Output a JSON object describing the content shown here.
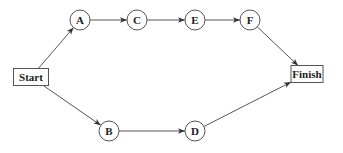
{
  "diagram": {
    "type": "network/precedence diagram",
    "nodes": [
      {
        "id": "start",
        "label": "Start",
        "shape": "box",
        "cx": 31,
        "cy": 77,
        "w": 35,
        "h": 17
      },
      {
        "id": "A",
        "label": "A",
        "shape": "circle",
        "cx": 80,
        "cy": 20,
        "r": 10
      },
      {
        "id": "C",
        "label": "C",
        "shape": "circle",
        "cx": 137,
        "cy": 20,
        "r": 10
      },
      {
        "id": "E",
        "label": "E",
        "shape": "circle",
        "cx": 195,
        "cy": 20,
        "r": 10
      },
      {
        "id": "F",
        "label": "F",
        "shape": "circle",
        "cx": 250,
        "cy": 20,
        "r": 10
      },
      {
        "id": "B",
        "label": "B",
        "shape": "circle",
        "cx": 109,
        "cy": 131,
        "r": 10
      },
      {
        "id": "D",
        "label": "D",
        "shape": "circle",
        "cx": 195,
        "cy": 131,
        "r": 10
      },
      {
        "id": "finish",
        "label": "Finish",
        "shape": "box",
        "cx": 307,
        "cy": 74,
        "w": 32,
        "h": 17
      }
    ],
    "edges": [
      {
        "from": "start",
        "to": "A"
      },
      {
        "from": "A",
        "to": "C"
      },
      {
        "from": "C",
        "to": "E"
      },
      {
        "from": "E",
        "to": "F"
      },
      {
        "from": "F",
        "to": "finish"
      },
      {
        "from": "start",
        "to": "B"
      },
      {
        "from": "B",
        "to": "D"
      },
      {
        "from": "D",
        "to": "finish"
      }
    ]
  }
}
